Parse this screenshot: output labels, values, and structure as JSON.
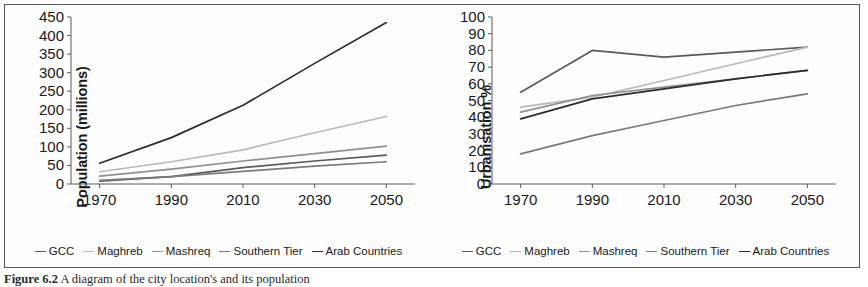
{
  "figure": {
    "caption_label": "Figure 6.2",
    "caption_text": "A diagram of the city location's and its population"
  },
  "legend": {
    "items": [
      {
        "label": "GCC",
        "color": "#5a5a5a"
      },
      {
        "label": "Maghreb",
        "color": "#b9b9b9"
      },
      {
        "label": "Mashreq",
        "color": "#8f8f8f"
      },
      {
        "label": "Southern Tier",
        "color": "#7a7a7a"
      },
      {
        "label": "Arab Countries",
        "color": "#2b2b2b"
      }
    ]
  },
  "chart_data": [
    {
      "type": "line",
      "id": "population",
      "title": "",
      "xlabel": "",
      "ylabel": "Population (millions)",
      "x": [
        1970,
        1990,
        2010,
        2030,
        2050
      ],
      "xticks": [
        "1970",
        "1990",
        "2010",
        "2030",
        "2050"
      ],
      "xlim": [
        1962,
        2058
      ],
      "ylim": [
        0,
        450
      ],
      "yticks": [
        0,
        50,
        100,
        150,
        200,
        250,
        300,
        350,
        400,
        450
      ],
      "grid": false,
      "legend_position": "bottom",
      "series": [
        {
          "name": "GCC",
          "color": "#5a5a5a",
          "values": [
            8,
            20,
            44,
            62,
            78
          ]
        },
        {
          "name": "Maghreb",
          "color": "#b9b9b9",
          "values": [
            33,
            60,
            92,
            138,
            182
          ]
        },
        {
          "name": "Mashreq",
          "color": "#8f8f8f",
          "values": [
            21,
            40,
            62,
            82,
            102
          ]
        },
        {
          "name": "Southern Tier",
          "color": "#7a7a7a",
          "values": [
            10,
            20,
            34,
            48,
            60
          ]
        },
        {
          "name": "Arab Countries",
          "color": "#2b2b2b",
          "values": [
            56,
            125,
            212,
            325,
            435
          ]
        }
      ]
    },
    {
      "type": "line",
      "id": "urbanisation",
      "title": "",
      "xlabel": "",
      "ylabel": "Urbanisation %",
      "x": [
        1970,
        1990,
        2010,
        2030,
        2050
      ],
      "xticks": [
        "1970",
        "1990",
        "2010",
        "2030",
        "2050"
      ],
      "xlim": [
        1962,
        2058
      ],
      "ylim": [
        0,
        100
      ],
      "yticks": [
        0,
        10,
        20,
        30,
        40,
        50,
        60,
        70,
        80,
        90,
        100
      ],
      "grid": false,
      "legend_position": "bottom",
      "series": [
        {
          "name": "GCC",
          "color": "#5a5a5a",
          "values": [
            55,
            80,
            76,
            79,
            82
          ]
        },
        {
          "name": "Maghreb",
          "color": "#b9b9b9",
          "values": [
            46,
            52,
            62,
            72,
            82
          ]
        },
        {
          "name": "Mashreq",
          "color": "#8f8f8f",
          "values": [
            43,
            53,
            58,
            63,
            68
          ]
        },
        {
          "name": "Southern Tier",
          "color": "#7a7a7a",
          "values": [
            18,
            29,
            38,
            47,
            54
          ]
        },
        {
          "name": "Arab Countries",
          "color": "#2b2b2b",
          "values": [
            39,
            51,
            57,
            63,
            68
          ]
        }
      ]
    }
  ]
}
